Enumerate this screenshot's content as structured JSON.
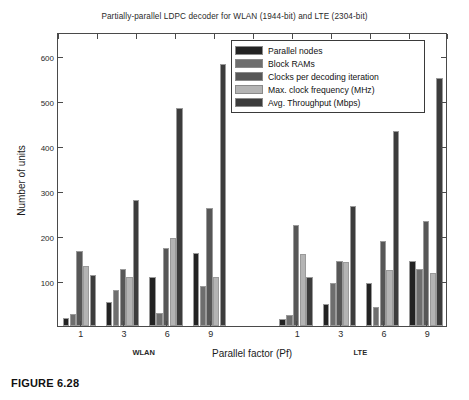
{
  "figure": {
    "caption": "FIGURE 6.28"
  },
  "chart_data": {
    "type": "bar",
    "title": "Partially-parallel LDPC decoder for WLAN (1944-bit) and LTE (2304-bit)",
    "xlabel": "Parallel factor (Pf)",
    "ylabel": "Number of units",
    "ylim": [
      0,
      650
    ],
    "yticks": [
      100,
      200,
      300,
      400,
      500,
      600
    ],
    "grid": false,
    "legend_position": "top-right-inside",
    "categories": [
      "1",
      "3",
      "6",
      "9",
      "1",
      "3",
      "6",
      "9"
    ],
    "group_labels": [
      "WLAN",
      "LTE"
    ],
    "series": [
      {
        "name": "Parallel nodes",
        "color": "#232323",
        "values": [
          17,
          54,
          108,
          162,
          16,
          48,
          96,
          144
        ]
      },
      {
        "name": "Block RAMs",
        "color": "#6e6e6e",
        "values": [
          27,
          81,
          30,
          90,
          24,
          96,
          43,
          128
        ]
      },
      {
        "name": "Clocks per decoding iteration",
        "color": "#575757",
        "values": [
          166,
          128,
          174,
          262,
          224,
          145,
          189,
          234
        ]
      },
      {
        "name": "Max. clock frequency (MHz)",
        "color": "#b4b4b4",
        "values": [
          133,
          110,
          196,
          110,
          160,
          142,
          125,
          119
        ]
      },
      {
        "name": "Avg. Throughput (Mbps)",
        "color": "#3c3c3c",
        "values": [
          114,
          281,
          486,
          583,
          110,
          267,
          434,
          551
        ]
      }
    ]
  }
}
